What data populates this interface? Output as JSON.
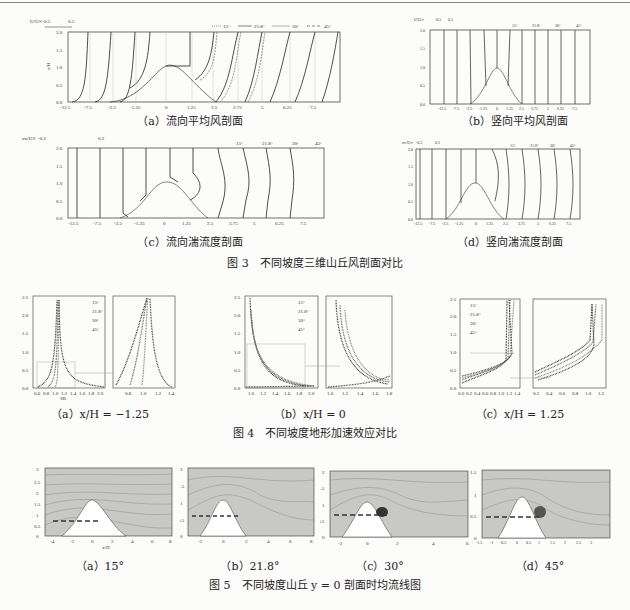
{
  "figure3": {
    "caption": "图 3　不同坡度三维山丘风剖面对比",
    "legend": [
      "15°",
      "21.8°",
      "30°",
      "45°"
    ],
    "panels": [
      {
        "id": "a",
        "caption": "（a）流向平均风剖面",
        "scale_label": "U/U∞",
        "scale_ticks": [
          "-0.5",
          "0.5"
        ],
        "xlabel": "x/H",
        "ylabel": "z/H",
        "xticks": [
          "-12.5",
          "-7.5",
          "-2.5",
          "-1.25",
          "0",
          "1.25",
          "2.5",
          "3.75",
          "5",
          "6.25",
          "7.5"
        ],
        "yticks": [
          "0.0",
          "0.5",
          "1.0",
          "1.5",
          "2.0"
        ]
      },
      {
        "id": "b",
        "caption": "（b）竖向平均风剖面",
        "scale_label": "U/U∞",
        "scale_ticks": [
          "-0.5",
          "0.5"
        ],
        "xlabel": "x/H",
        "ylabel": "z/H",
        "xticks": [
          "-12.5",
          "-7.5",
          "-2.5",
          "-1.25",
          "0",
          "1.25",
          "2.5",
          "3.75",
          "5",
          "6.25",
          "7.5"
        ],
        "yticks": [
          "0.0",
          "0.5",
          "1.0",
          "1.5",
          "2.0"
        ]
      },
      {
        "id": "c",
        "caption": "（c）流向湍流度剖面",
        "scale_label": "σu/U∞",
        "scale_ticks": [
          "-0.2",
          "0.2"
        ],
        "xlabel": "x/H",
        "ylabel": "z/H",
        "xticks": [
          "-12.5",
          "-7.5",
          "-2.5",
          "-1.25",
          "0",
          "1.25",
          "2.5",
          "3.75",
          "5",
          "6.25",
          "7.5"
        ],
        "yticks": [
          "0.0",
          "0.5",
          "1.0",
          "1.5",
          "2.0"
        ]
      },
      {
        "id": "d",
        "caption": "（d）竖向湍流度剖面",
        "scale_label": "σv/U∞",
        "scale_ticks": [
          "-0.2",
          "0.2"
        ],
        "xlabel": "x/H",
        "ylabel": "z/H",
        "xticks": [
          "-12.5",
          "-7.5",
          "-2.5",
          "-1.25",
          "0",
          "1.25",
          "2.5",
          "3.75",
          "5",
          "6.25",
          "7.5"
        ],
        "yticks": [
          "0.0",
          "0.5",
          "1.0",
          "1.5",
          "2.0"
        ]
      }
    ]
  },
  "figure4": {
    "caption": "图 4　不同坡度地形加速效应对比",
    "legend": [
      "15°",
      "21.8°",
      "30°",
      "45°"
    ],
    "panels": [
      {
        "id": "a",
        "caption": "（a）x/H = −1.25",
        "xlabel": "SR",
        "ylabel": "z/H",
        "xticks": [
          "0.6",
          "0.8",
          "1.0",
          "1.2",
          "1.4",
          "1.6",
          "1.8",
          "2.0"
        ],
        "yticks": [
          "0.0",
          "0.5",
          "1.0",
          "1.5",
          "2.0",
          "2.5"
        ],
        "inset_xticks": [
          "0.8",
          "1.0",
          "1.2",
          "1.4"
        ],
        "inset_yticks": [
          "0.1",
          "0.2",
          "0.3",
          "0.4",
          "0.5",
          "0.6",
          "0.7"
        ]
      },
      {
        "id": "b",
        "caption": "（b）x/H = 0",
        "xlabel": "SR",
        "ylabel": "z/H",
        "xticks": [
          "1.0",
          "1.2",
          "1.4",
          "1.6",
          "1.8",
          "2.0"
        ],
        "yticks": [
          "0.0",
          "0.5",
          "1.0",
          "1.5",
          "2.0",
          "2.5"
        ],
        "inset_xticks": [
          "1.0",
          "1.2",
          "1.4",
          "1.6",
          "1.8"
        ],
        "inset_yticks": [
          "0.0",
          "0.2",
          "0.4",
          "0.6",
          "0.8",
          "1.0",
          "1.2"
        ]
      },
      {
        "id": "c",
        "caption": "（c）x/H = 1.25",
        "xlabel": "SR",
        "ylabel": "z/H",
        "xticks": [
          "0.0",
          "0.2",
          "0.4",
          "0.6",
          "0.8",
          "1.0",
          "1.2",
          "1.4"
        ],
        "yticks": [
          "0.0",
          "0.5",
          "1.0",
          "1.5",
          "2.0",
          "2.5"
        ],
        "inset_xticks": [
          "0.2",
          "0.4",
          "0.6",
          "0.8",
          "1.0",
          "1.2"
        ],
        "inset_yticks": [
          "0.2",
          "0.4",
          "0.6",
          "0.8",
          "1.0",
          "1.2"
        ]
      }
    ]
  },
  "figure5": {
    "caption": "图 5　不同坡度山丘 y = 0 剖面时均流线图",
    "panels": [
      {
        "id": "a",
        "caption": "（a）15°",
        "xlabel": "x/H",
        "ylabel": "z/H",
        "xticks": [
          "-4",
          "-2",
          "0",
          "2",
          "4",
          "6",
          "8"
        ],
        "yticks": [
          "0",
          "0.5",
          "1",
          "1.5",
          "2",
          "2.5",
          "3"
        ]
      },
      {
        "id": "b",
        "caption": "（b）21.8°",
        "xlabel": "x/H",
        "ylabel": "z/H",
        "xticks": [
          "-2",
          "0",
          "2",
          "4",
          "6",
          "8"
        ],
        "yticks": [
          "0",
          "0.5",
          "1",
          "1.5",
          "2"
        ]
      },
      {
        "id": "c",
        "caption": "（c）30°",
        "xlabel": "x/H",
        "ylabel": "z/H",
        "xticks": [
          "-2",
          "0",
          "2",
          "4",
          "6"
        ],
        "yticks": [
          "0",
          "0.5",
          "1",
          "1.5",
          "2"
        ]
      },
      {
        "id": "d",
        "caption": "（d）45°",
        "xlabel": "x/H",
        "ylabel": "z/H",
        "xticks": [
          "-1.5",
          "-1",
          "-0.5",
          "0",
          "0.5",
          "1",
          "1.5",
          "2",
          "2.5",
          "3"
        ],
        "yticks": [
          "0",
          "0.5",
          "1",
          "1.5"
        ]
      }
    ]
  }
}
